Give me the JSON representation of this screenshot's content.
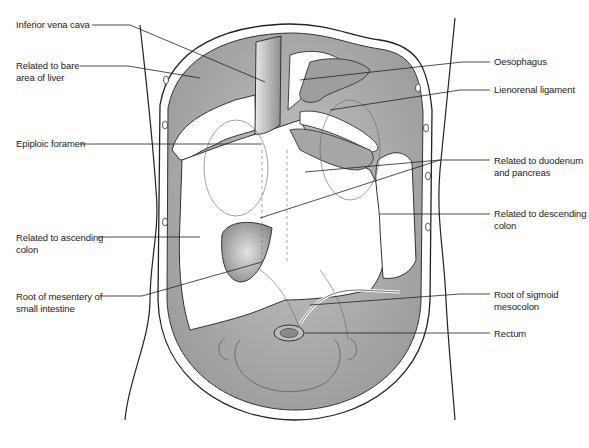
{
  "labels_left": [
    {
      "id": "ivc",
      "lines": [
        "Inferior vena cava"
      ]
    },
    {
      "id": "bare-area",
      "lines": [
        "Related to bare",
        "area of liver"
      ]
    },
    {
      "id": "epiploic",
      "lines": [
        "Epiploic foramen"
      ]
    },
    {
      "id": "ascending",
      "lines": [
        "Related to ascending",
        "colon"
      ]
    },
    {
      "id": "mesentery",
      "lines": [
        "Root of mesentery of",
        "small intestine"
      ]
    }
  ],
  "labels_right": [
    {
      "id": "oesophagus",
      "lines": [
        "Oesophagus"
      ]
    },
    {
      "id": "lienorenal",
      "lines": [
        "Lienorenal ligament"
      ]
    },
    {
      "id": "duodenum",
      "lines": [
        "Related to duodenum",
        "and pancreas"
      ]
    },
    {
      "id": "descending",
      "lines": [
        "Related to descending",
        "colon"
      ]
    },
    {
      "id": "sigmoid",
      "lines": [
        "Root of sigmoid",
        "mesocolon"
      ]
    },
    {
      "id": "rectum",
      "lines": [
        "Rectum"
      ]
    }
  ],
  "colors": {
    "peritoneum_fill": "#a9a9a9",
    "outline": "#2a2a2a",
    "background": "#ffffff"
  }
}
